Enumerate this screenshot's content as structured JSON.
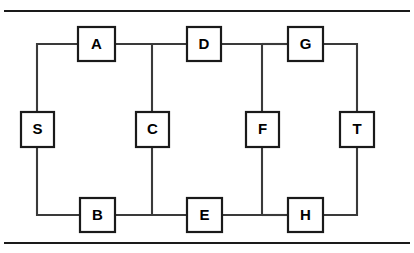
{
  "figure": {
    "title": "",
    "background_color": "#ffffff",
    "line_color": "#3a3a3a",
    "node_stroke_color": "#1a1a1a",
    "node_fill_color": "#ffffff",
    "label_color": "#000000",
    "top_rule_label": "",
    "bottom_rule_label": ""
  },
  "diagram": {
    "type": "node-link-graph",
    "nodes": [
      {
        "id": "S",
        "label": "S",
        "x": 37,
        "y": 129
      },
      {
        "id": "A",
        "label": "A",
        "x": 97,
        "y": 44
      },
      {
        "id": "B",
        "label": "B",
        "x": 97,
        "y": 215
      },
      {
        "id": "C",
        "label": "C",
        "x": 152,
        "y": 129
      },
      {
        "id": "D",
        "label": "D",
        "x": 204,
        "y": 44
      },
      {
        "id": "E",
        "label": "E",
        "x": 204,
        "y": 215
      },
      {
        "id": "F",
        "label": "F",
        "x": 262,
        "y": 129
      },
      {
        "id": "G",
        "label": "G",
        "x": 306,
        "y": 44
      },
      {
        "id": "H",
        "label": "H",
        "x": 306,
        "y": 215
      },
      {
        "id": "T",
        "label": "T",
        "x": 357,
        "y": 129
      }
    ],
    "edges": [
      {
        "from": "S",
        "to": "A",
        "label": ""
      },
      {
        "from": "S",
        "to": "B",
        "label": ""
      },
      {
        "from": "A",
        "to": "C",
        "label": ""
      },
      {
        "from": "A",
        "to": "D",
        "label": ""
      },
      {
        "from": "B",
        "to": "C",
        "label": ""
      },
      {
        "from": "B",
        "to": "E",
        "label": ""
      },
      {
        "from": "D",
        "to": "F",
        "label": ""
      },
      {
        "from": "D",
        "to": "G",
        "label": ""
      },
      {
        "from": "E",
        "to": "F",
        "label": ""
      },
      {
        "from": "E",
        "to": "H",
        "label": ""
      },
      {
        "from": "G",
        "to": "T",
        "label": ""
      },
      {
        "from": "H",
        "to": "T",
        "label": ""
      }
    ]
  }
}
